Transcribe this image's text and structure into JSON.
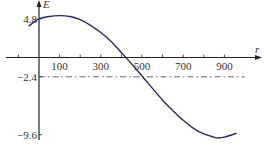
{
  "chart_data": {
    "type": "line",
    "title": "",
    "xlabel": "r",
    "ylabel": "E",
    "xlim": [
      -120,
      1000
    ],
    "ylim": [
      -10.5,
      6.2
    ],
    "grid": false,
    "legend": null,
    "x_ticks": [
      100,
      300,
      500,
      700,
      900
    ],
    "x_minor_ticks": [
      -100,
      200,
      400,
      600,
      800
    ],
    "y_ticks": [
      4.8,
      -2.4,
      -9.6
    ],
    "x_tick_labels": [
      "100",
      "300",
      "500",
      "700",
      "900"
    ],
    "y_tick_labels": [
      "4.8",
      "-2.4",
      "-9.6"
    ],
    "series": [
      {
        "name": "E(r)",
        "color": "#2b2a5e",
        "style": "solid",
        "x": [
          -50,
          0,
          50,
          100,
          150,
          200,
          250,
          300,
          350,
          400,
          450,
          500,
          550,
          600,
          650,
          700,
          750,
          800,
          850,
          870,
          900,
          960
        ],
        "y": [
          3.9,
          4.8,
          5.1,
          5.2,
          5.1,
          4.7,
          4.0,
          3.1,
          2.0,
          0.6,
          -0.8,
          -2.3,
          -3.8,
          -5.3,
          -6.6,
          -7.8,
          -8.8,
          -9.5,
          -9.9,
          -10.0,
          -9.9,
          -9.4
        ]
      },
      {
        "name": "E = -2.4",
        "color": "#555555",
        "style": "dashdot",
        "x": [
          0,
          1000
        ],
        "y": [
          -2.4,
          -2.4
        ]
      }
    ],
    "annotations": []
  }
}
